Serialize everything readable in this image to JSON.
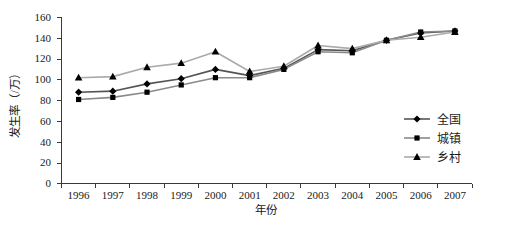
{
  "chart_data": {
    "type": "line",
    "title": "",
    "xlabel": "年份",
    "ylabel": "发生率（/万）",
    "categories": [
      "1996",
      "1997",
      "1998",
      "1999",
      "2000",
      "2001",
      "2002",
      "2003",
      "2004",
      "2005",
      "2006",
      "2007"
    ],
    "series": [
      {
        "name": "全国",
        "marker": "diamond",
        "color": "#000000",
        "line_color": "#555555",
        "values": [
          88,
          89,
          96,
          101,
          110,
          104,
          111,
          129,
          128,
          138,
          145,
          147
        ]
      },
      {
        "name": "城镇",
        "marker": "square",
        "color": "#000000",
        "line_color": "#8a8a8a",
        "values": [
          81,
          83,
          88,
          95,
          102,
          102,
          110,
          127,
          126,
          138,
          146,
          147
        ]
      },
      {
        "name": "乡村",
        "marker": "triangle",
        "color": "#000000",
        "line_color": "#aaaaaa",
        "values": [
          102,
          103,
          112,
          116,
          127,
          108,
          113,
          133,
          130,
          138,
          141,
          146
        ]
      }
    ],
    "ylim": [
      0,
      160
    ],
    "yticks": [
      "0",
      "20",
      "40",
      "60",
      "80",
      "100",
      "120",
      "140",
      "160"
    ],
    "ytick_values": [
      0,
      20,
      40,
      60,
      80,
      100,
      120,
      140,
      160
    ],
    "grid": false,
    "legend_position": "right-middle"
  }
}
